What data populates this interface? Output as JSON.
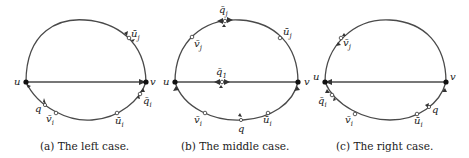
{
  "figure": {
    "panels": [
      {
        "id": "a",
        "caption": "(a) The left case.",
        "labels": {
          "u": "u",
          "v": "v",
          "uj": "ū",
          "uj_sub": "j",
          "qi": "q̄",
          "qi_sub": "i",
          "q": "q",
          "vi": "v̄",
          "vi_sub": "i",
          "ui": "ū",
          "ui_sub": "i"
        },
        "chord_direction": "u→v"
      },
      {
        "id": "b",
        "caption": "(b) The middle case.",
        "labels": {
          "u": "u",
          "v": "v",
          "qj": "q̄",
          "qj_sub": "j",
          "vj": "v̄",
          "vj_sub": "j",
          "uj": "ū",
          "uj_sub": "j",
          "q1": "q̄",
          "q1_sub": "1",
          "vi": "v̄",
          "vi_sub": "i",
          "q": "q",
          "ui": "ū",
          "ui_sub": "i"
        },
        "chord_direction": "v→u"
      },
      {
        "id": "c",
        "caption": "(c) The right case.",
        "labels": {
          "u": "u",
          "v": "v",
          "vj": "v̄",
          "vj_sub": "j",
          "qi": "q̄",
          "qi_sub": "i",
          "vi": "v̄",
          "vi_sub": "i",
          "ui": "ū",
          "ui_sub": "i",
          "q": "q"
        },
        "chord_direction": "v→u"
      }
    ],
    "colors": {
      "edge": "#4a4a4a",
      "arrow": "#3a3a3a",
      "vertex": "#111111",
      "marker_fill": "#ffffff"
    }
  }
}
